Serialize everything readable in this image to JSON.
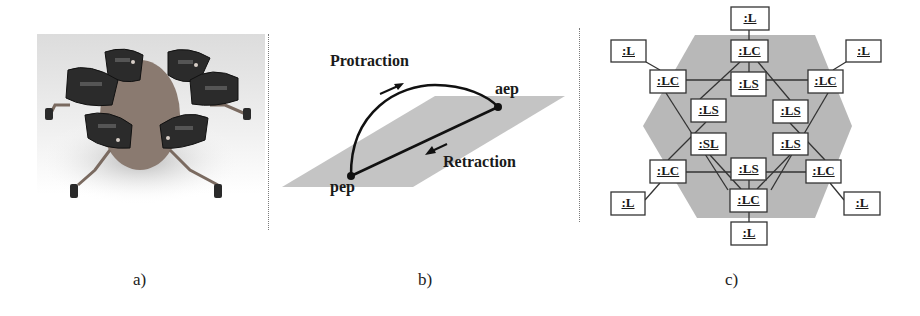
{
  "figure": {
    "panels": [
      {
        "id": "a",
        "caption": "a)",
        "content": "photograph of hexapod walking robot with six circuit-board leg modules"
      },
      {
        "id": "b",
        "caption": "b)",
        "labels": {
          "protraction": "Protraction",
          "retraction": "Retraction",
          "aep": "aep",
          "pep": "pep"
        }
      },
      {
        "id": "c",
        "caption": "c)",
        "nodes": [
          {
            "id": "L_top",
            "label": ":L"
          },
          {
            "id": "LC_top",
            "label": ":LC"
          },
          {
            "id": "LS_top",
            "label": ":LS"
          },
          {
            "id": "L_ul",
            "label": ":L"
          },
          {
            "id": "L_ur",
            "label": ":L"
          },
          {
            "id": "LC_ul",
            "label": ":LC"
          },
          {
            "id": "LC_ur",
            "label": ":LC"
          },
          {
            "id": "LS_ul",
            "label": ":LS"
          },
          {
            "id": "LS_ur",
            "label": ":LS"
          },
          {
            "id": "SL_center",
            "label": ":SL"
          },
          {
            "id": "LS_lr",
            "label": ":LS"
          },
          {
            "id": "LC_ll",
            "label": ":LC"
          },
          {
            "id": "LS_bottom",
            "label": ":LS"
          },
          {
            "id": "LC_lr",
            "label": ":LC"
          },
          {
            "id": "LC_bottom",
            "label": ":LC"
          },
          {
            "id": "L_bottom",
            "label": ":L"
          },
          {
            "id": "L_ll",
            "label": ":L"
          },
          {
            "id": "L_lr",
            "label": ":L"
          }
        ]
      }
    ]
  },
  "colors": {
    "plane_gray": "#c4c4c4",
    "hexagon_gray": "#b8b8b8",
    "line": "#1a1a1a"
  }
}
